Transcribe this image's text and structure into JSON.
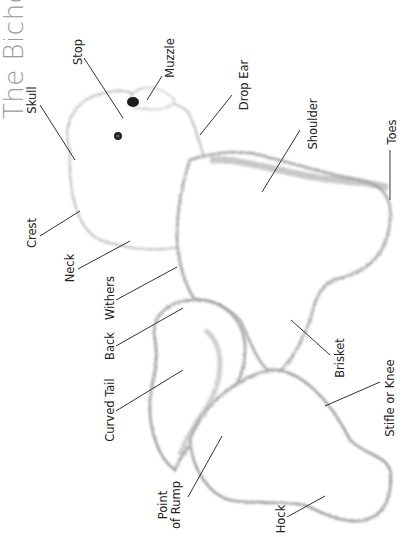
{
  "page": {
    "title": "The Bicho",
    "figure": "Bichon Frise anatomy illustration (rotated)"
  },
  "labels": {
    "skull": "Skull",
    "stop": "Stop",
    "muzzle": "Muzzle",
    "drop_ear": "Drop Ear",
    "shoulder": "Shoulder",
    "toes": "Toes",
    "crest": "Crest",
    "neck": "Neck",
    "withers": "Withers",
    "back": "Back",
    "curved_tail": "Curved Tail",
    "point_of_rump_1": "Point",
    "point_of_rump_2": "of Rump",
    "brisket": "Brisket",
    "stifle_or_knee": "Stifle or Knee",
    "hock": "Hock"
  },
  "colors": {
    "title": "#9a9a9a",
    "label_text": "#222222",
    "leader_line": "#333333",
    "fur_outline": "#b8b8b8",
    "fur_fill": "#ffffff"
  }
}
